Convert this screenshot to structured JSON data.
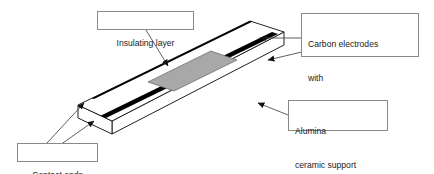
{
  "figure": {
    "type": "technical-diagram",
    "colors": {
      "background": "#ffffff",
      "outline": "#231f20",
      "electrode_black": "#000000",
      "insulating_gray": "#a8a8a8",
      "callout_border": "#8a8a8a",
      "leader_line": "#4d4d4d",
      "text": "#1a1a1a"
    }
  },
  "callouts": {
    "insulating": {
      "name": "Insulating layer",
      "lines": [
        "Insulating layer"
      ]
    },
    "carbon": {
      "name": "Carbon electrodes with OPH/Nafion layer",
      "lines": [
        "Carbon electrodes",
        "with",
        "OPH/Nafion layer"
      ]
    },
    "alumina": {
      "name": "Alumina ceramic support",
      "lines": [
        "Alumina",
        "ceramic support"
      ]
    },
    "contact": {
      "name": "Contact ends",
      "lines": [
        "Contact ends"
      ]
    }
  },
  "parts": {
    "substrate": "alumina-ceramic-slab",
    "electrode_count": 2,
    "electrode_label": "carbon electrode stripe",
    "insulating_patch": "insulating layer patch",
    "contact_ends": "contact ends"
  }
}
